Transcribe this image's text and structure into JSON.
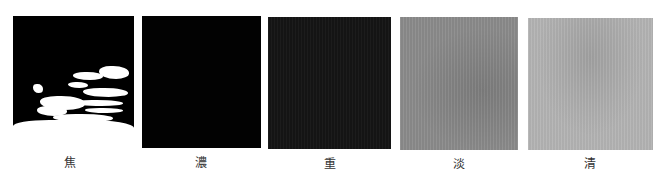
{
  "figure": {
    "panels": [
      {
        "id": "p1",
        "label": "焦",
        "tone": "black with white patches",
        "color": "#000000"
      },
      {
        "id": "p2",
        "label": "濃",
        "tone": "solid black",
        "color": "#020202"
      },
      {
        "id": "p3",
        "label": "重",
        "tone": "near black",
        "color": "#141414"
      },
      {
        "id": "p4",
        "label": "淡",
        "tone": "medium gray",
        "color": "#8b8b8b"
      },
      {
        "id": "p5",
        "label": "清",
        "tone": "light gray",
        "color": "#b3b3b3"
      }
    ]
  }
}
